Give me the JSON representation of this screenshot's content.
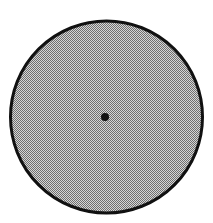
{
  "figure": {
    "canvas": {
      "width": 213,
      "height": 223,
      "background_color": "#ffffff"
    },
    "circle": {
      "name": "large-circle",
      "center_x": 106.5,
      "center_y": 117,
      "radius": 96,
      "fill_color": "#a9a9a9",
      "fill_style": "halftone-dither-50",
      "stroke_color": "#111111",
      "stroke_width": 3
    },
    "center_point": {
      "name": "center-dot",
      "center_x": 105,
      "center_y": 117,
      "radius": 4,
      "fill_color": "#111111"
    }
  },
  "chart_data": {
    "type": "scatter",
    "xlabel": "",
    "ylabel": "",
    "xlim": [
      0,
      213
    ],
    "ylim": [
      0,
      223
    ],
    "grid": false,
    "legend": "none",
    "annotations": [],
    "shapes": [
      {
        "kind": "circle",
        "label": "large-circle",
        "cx": 106.5,
        "cy": 117,
        "r": 96,
        "fill": "#a9a9a9",
        "stroke": "#111111",
        "stroke_width": 3
      },
      {
        "kind": "circle",
        "label": "center-dot",
        "cx": 105,
        "cy": 117,
        "r": 4,
        "fill": "#111111",
        "stroke": "none",
        "stroke_width": 0
      }
    ],
    "x": [
      105
    ],
    "y": [
      117
    ]
  }
}
